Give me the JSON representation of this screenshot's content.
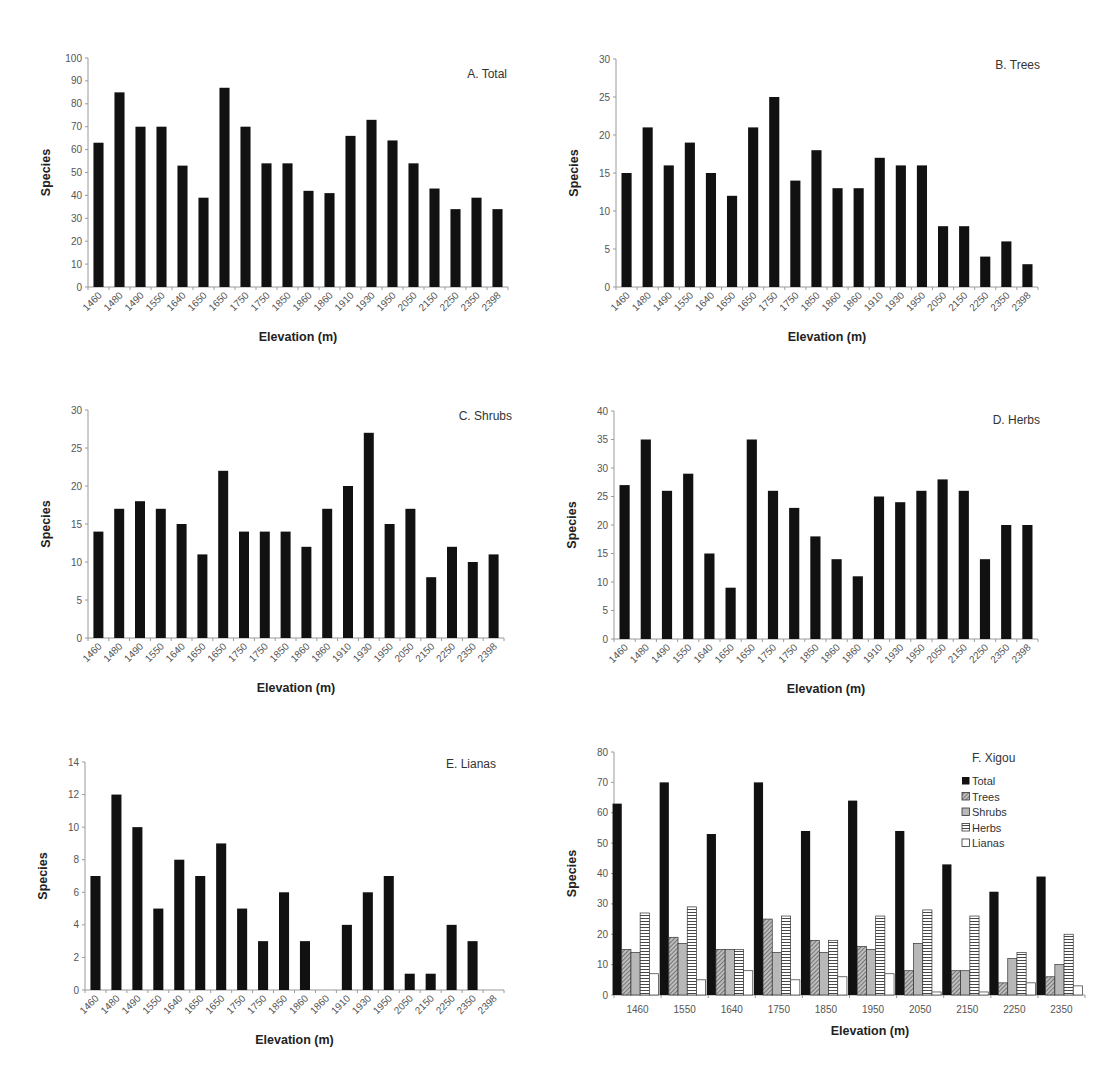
{
  "figure": {
    "panels": [
      "A. Total",
      "B. Trees",
      "C. Shrubs",
      "D. Herbs",
      "E. Lianas",
      "F. Xigou"
    ]
  },
  "colors": {
    "bar": "#111111",
    "axis": "#9a9a9a",
    "tick_label": "#555555",
    "trees_fill": "#9a9a9a",
    "shrubs_fill": "#b8b8b8",
    "herbs_fill": "#ffffff",
    "lianas_fill": "#ffffff"
  },
  "chart_data": [
    {
      "id": "A",
      "type": "bar",
      "title": "A. Total",
      "xlabel": "Elevation (m)",
      "ylabel": "Species",
      "ylim": [
        0,
        100
      ],
      "yticks": [
        0,
        10,
        20,
        30,
        40,
        50,
        60,
        70,
        80,
        90,
        100
      ],
      "grid": false,
      "categories": [
        "1460",
        "1480",
        "1490",
        "1550",
        "1640",
        "1650",
        "1650",
        "1750",
        "1750",
        "1850",
        "1860",
        "1860",
        "1910",
        "1930",
        "1950",
        "2050",
        "2150",
        "2250",
        "2350",
        "2398"
      ],
      "values": [
        63,
        85,
        70,
        70,
        53,
        39,
        87,
        70,
        54,
        54,
        42,
        41,
        66,
        73,
        64,
        54,
        43,
        34,
        39,
        34
      ]
    },
    {
      "id": "B",
      "type": "bar",
      "title": "B. Trees",
      "xlabel": "Elevation (m)",
      "ylabel": "Species",
      "ylim": [
        0,
        30
      ],
      "yticks": [
        0,
        5,
        10,
        15,
        20,
        25,
        30
      ],
      "grid": false,
      "categories": [
        "1460",
        "1480",
        "1490",
        "1550",
        "1640",
        "1650",
        "1650",
        "1750",
        "1750",
        "1850",
        "1860",
        "1860",
        "1910",
        "1930",
        "1950",
        "2050",
        "2150",
        "2250",
        "2350",
        "2398"
      ],
      "values": [
        15,
        21,
        16,
        19,
        15,
        12,
        21,
        25,
        14,
        18,
        13,
        13,
        17,
        16,
        16,
        8,
        8,
        4,
        6,
        3
      ]
    },
    {
      "id": "C",
      "type": "bar",
      "title": "C. Shrubs",
      "xlabel": "Elevation (m)",
      "ylabel": "Species",
      "ylim": [
        0,
        30
      ],
      "yticks": [
        0,
        5,
        10,
        15,
        20,
        25,
        30
      ],
      "grid": false,
      "categories": [
        "1460",
        "1480",
        "1490",
        "1550",
        "1640",
        "1650",
        "1650",
        "1750",
        "1750",
        "1850",
        "1860",
        "1860",
        "1910",
        "1930",
        "1950",
        "2050",
        "2150",
        "2250",
        "2350",
        "2398"
      ],
      "values": [
        14,
        17,
        18,
        17,
        15,
        11,
        22,
        14,
        14,
        14,
        12,
        17,
        20,
        27,
        15,
        17,
        8,
        12,
        10,
        11
      ]
    },
    {
      "id": "D",
      "type": "bar",
      "title": "D. Herbs",
      "xlabel": "Elevation (m)",
      "ylabel": "Species",
      "ylim": [
        0,
        40
      ],
      "yticks": [
        0,
        5,
        10,
        15,
        20,
        25,
        30,
        35,
        40
      ],
      "grid": false,
      "categories": [
        "1460",
        "1480",
        "1490",
        "1550",
        "1640",
        "1650",
        "1650",
        "1750",
        "1750",
        "1850",
        "1860",
        "1860",
        "1910",
        "1930",
        "1950",
        "2050",
        "2150",
        "2250",
        "2350",
        "2398"
      ],
      "values": [
        27,
        35,
        26,
        29,
        15,
        9,
        35,
        26,
        23,
        18,
        14,
        11,
        25,
        24,
        26,
        28,
        26,
        14,
        20,
        20
      ]
    },
    {
      "id": "E",
      "type": "bar",
      "title": "E. Lianas",
      "xlabel": "Elevation (m)",
      "ylabel": "Species",
      "ylim": [
        0,
        14
      ],
      "yticks": [
        0,
        2,
        4,
        6,
        8,
        10,
        12,
        14
      ],
      "grid": false,
      "categories": [
        "1460",
        "1480",
        "1490",
        "1550",
        "1640",
        "1650",
        "1650",
        "1750",
        "1750",
        "1850",
        "1860",
        "1860",
        "1910",
        "1930",
        "1950",
        "2050",
        "2150",
        "2250",
        "2350",
        "2398"
      ],
      "values": [
        7,
        12,
        10,
        5,
        8,
        7,
        9,
        5,
        3,
        6,
        3,
        0,
        4,
        6,
        7,
        1,
        1,
        4,
        3,
        0
      ]
    },
    {
      "id": "F",
      "type": "bar",
      "title": "F. Xigou",
      "xlabel": "Elevation (m)",
      "ylabel": "Species",
      "ylim": [
        0,
        80
      ],
      "yticks": [
        0,
        10,
        20,
        30,
        40,
        50,
        60,
        70,
        80
      ],
      "grid": false,
      "legend_position": "upper right",
      "categories": [
        "1460",
        "1550",
        "1640",
        "1750",
        "1850",
        "1950",
        "2050",
        "2150",
        "2250",
        "2350"
      ],
      "series": [
        {
          "name": "Total",
          "pattern": "solid-black",
          "values": [
            63,
            70,
            53,
            70,
            54,
            64,
            54,
            43,
            34,
            39
          ]
        },
        {
          "name": "Trees",
          "pattern": "diagonal-hatch",
          "values": [
            15,
            19,
            15,
            25,
            18,
            16,
            8,
            8,
            4,
            6
          ]
        },
        {
          "name": "Shrubs",
          "pattern": "light-gray",
          "values": [
            14,
            17,
            15,
            14,
            14,
            15,
            17,
            8,
            12,
            10
          ]
        },
        {
          "name": "Herbs",
          "pattern": "horizontal-lines",
          "values": [
            27,
            29,
            15,
            26,
            18,
            26,
            28,
            26,
            14,
            20
          ]
        },
        {
          "name": "Lianas",
          "pattern": "white",
          "values": [
            7,
            5,
            8,
            5,
            6,
            7,
            1,
            1,
            4,
            3
          ]
        }
      ]
    }
  ],
  "layout": [
    {
      "x0": 88,
      "x1": 508,
      "y0": 58,
      "y1": 287,
      "title_x": 507,
      "title_y": 78
    },
    {
      "x0": 616,
      "x1": 1038,
      "y0": 59,
      "y1": 287,
      "title_x": 1040,
      "title_y": 69
    },
    {
      "x0": 88,
      "x1": 504,
      "y0": 410,
      "y1": 638,
      "title_x": 512,
      "title_y": 420
    },
    {
      "x0": 614,
      "x1": 1038,
      "y0": 411,
      "y1": 639,
      "title_x": 1040,
      "title_y": 424
    },
    {
      "x0": 85,
      "x1": 504,
      "y0": 762,
      "y1": 990,
      "title_x": 496,
      "title_y": 768
    },
    {
      "x0": 614,
      "x1": 1085,
      "y0": 752,
      "y1": 995,
      "title_x": 972,
      "title_y": 762
    }
  ]
}
